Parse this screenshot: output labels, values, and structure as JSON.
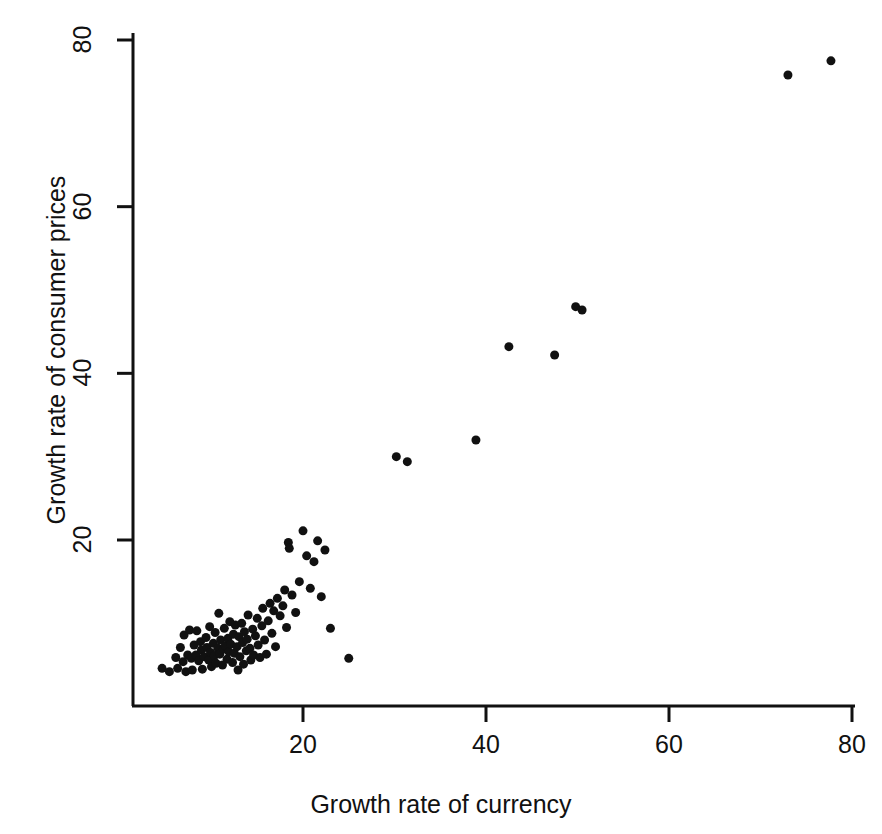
{
  "chart_data": {
    "type": "scatter",
    "title": "",
    "xlabel": "Growth rate of currency",
    "ylabel": "Growth rate of consumer prices",
    "xlim": [
      3.5,
      81.5
    ],
    "ylim": [
      3.0,
      81.0
    ],
    "xticks": [
      20,
      40,
      60,
      80
    ],
    "yticks": [
      20,
      40,
      60,
      80
    ],
    "xtick_labels": [
      "20",
      "40",
      "60",
      "80"
    ],
    "ytick_labels": [
      "20",
      "40",
      "60",
      "80"
    ],
    "grid": false,
    "legend": "none",
    "marker": "filled-circle",
    "marker_color": "#111111",
    "marker_size_px": 9,
    "points": [
      [
        4.6,
        4.6
      ],
      [
        5.4,
        4.2
      ],
      [
        6.1,
        5.9
      ],
      [
        6.3,
        4.6
      ],
      [
        6.6,
        7.1
      ],
      [
        6.9,
        5.4
      ],
      [
        7.0,
        8.6
      ],
      [
        7.2,
        4.2
      ],
      [
        7.4,
        6.2
      ],
      [
        7.6,
        9.2
      ],
      [
        7.8,
        5.8
      ],
      [
        7.9,
        4.4
      ],
      [
        8.1,
        7.4
      ],
      [
        8.3,
        6.2
      ],
      [
        8.4,
        9.1
      ],
      [
        8.6,
        5.5
      ],
      [
        8.8,
        7.8
      ],
      [
        8.9,
        6.8
      ],
      [
        9.0,
        4.5
      ],
      [
        9.2,
        6.0
      ],
      [
        9.4,
        8.3
      ],
      [
        9.5,
        7.1
      ],
      [
        9.7,
        5.6
      ],
      [
        9.8,
        9.6
      ],
      [
        9.9,
        6.5
      ],
      [
        10.0,
        4.8
      ],
      [
        10.2,
        7.6
      ],
      [
        10.3,
        6.1
      ],
      [
        10.4,
        8.9
      ],
      [
        10.5,
        5.2
      ],
      [
        10.7,
        7.0
      ],
      [
        10.8,
        11.2
      ],
      [
        10.9,
        6.3
      ],
      [
        11.0,
        8.0
      ],
      [
        11.2,
        5.0
      ],
      [
        11.3,
        6.9
      ],
      [
        11.4,
        9.4
      ],
      [
        11.5,
        7.3
      ],
      [
        11.7,
        5.7
      ],
      [
        11.8,
        8.2
      ],
      [
        11.9,
        6.6
      ],
      [
        12.0,
        10.2
      ],
      [
        12.1,
        7.5
      ],
      [
        12.3,
        5.3
      ],
      [
        12.4,
        8.7
      ],
      [
        12.5,
        6.4
      ],
      [
        12.6,
        9.8
      ],
      [
        12.8,
        7.2
      ],
      [
        12.9,
        4.4
      ],
      [
        13.0,
        8.4
      ],
      [
        13.1,
        6.0
      ],
      [
        13.3,
        10.0
      ],
      [
        13.4,
        7.7
      ],
      [
        13.5,
        5.1
      ],
      [
        13.6,
        9.0
      ],
      [
        13.8,
        6.7
      ],
      [
        13.9,
        8.1
      ],
      [
        14.0,
        11.0
      ],
      [
        14.2,
        7.0
      ],
      [
        14.3,
        5.6
      ],
      [
        14.5,
        9.3
      ],
      [
        14.6,
        6.2
      ],
      [
        14.8,
        8.5
      ],
      [
        15.0,
        10.6
      ],
      [
        15.1,
        7.4
      ],
      [
        15.3,
        5.9
      ],
      [
        15.5,
        9.7
      ],
      [
        15.6,
        11.8
      ],
      [
        15.8,
        8.0
      ],
      [
        16.0,
        6.3
      ],
      [
        16.2,
        10.3
      ],
      [
        16.4,
        12.4
      ],
      [
        16.6,
        8.8
      ],
      [
        16.8,
        11.5
      ],
      [
        17.0,
        7.2
      ],
      [
        17.2,
        13.0
      ],
      [
        17.5,
        10.9
      ],
      [
        17.8,
        12.1
      ],
      [
        18.0,
        14.0
      ],
      [
        18.2,
        9.5
      ],
      [
        18.4,
        19.7
      ],
      [
        18.5,
        19.0
      ],
      [
        18.8,
        13.4
      ],
      [
        19.2,
        11.3
      ],
      [
        19.6,
        15.0
      ],
      [
        20.0,
        21.1
      ],
      [
        20.4,
        18.1
      ],
      [
        20.8,
        14.2
      ],
      [
        21.2,
        17.4
      ],
      [
        21.6,
        19.9
      ],
      [
        22.0,
        13.2
      ],
      [
        22.4,
        18.8
      ],
      [
        23.0,
        9.4
      ],
      [
        25.0,
        5.8
      ],
      [
        30.2,
        30.0
      ],
      [
        31.4,
        29.4
      ],
      [
        38.9,
        32.0
      ],
      [
        42.5,
        43.2
      ],
      [
        47.5,
        42.2
      ],
      [
        49.8,
        48.0
      ],
      [
        50.5,
        47.6
      ],
      [
        73.0,
        75.8
      ],
      [
        77.7,
        77.5
      ]
    ]
  },
  "axes": {
    "x_axis_label": "Growth rate of currency",
    "y_axis_label": "Growth rate of consumer prices"
  }
}
